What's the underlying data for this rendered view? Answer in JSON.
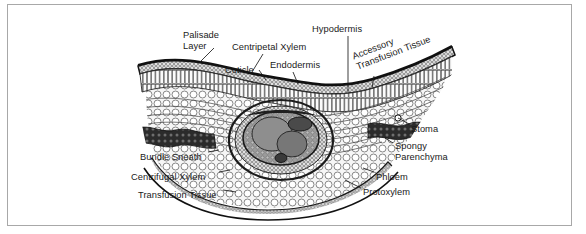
{
  "figure": {
    "style": "grayscale line drawing / scanned halftone",
    "background": "#ffffff",
    "border_color": "#a8a8a8",
    "ink_color": "#1a1a1a"
  },
  "labels": [
    {
      "id": "palisade-layer",
      "text": "Palisade\nLayer",
      "x": 183,
      "y": 30,
      "align": "left",
      "rotated": false
    },
    {
      "id": "centripetal-xylem",
      "text": "Centripetal Xylem",
      "x": 232,
      "y": 42,
      "align": "left",
      "rotated": false
    },
    {
      "id": "cuticle",
      "text": "Cuticle",
      "x": 225,
      "y": 65,
      "align": "left",
      "rotated": false
    },
    {
      "id": "endodermis",
      "text": "Endodermis",
      "x": 270,
      "y": 60,
      "align": "left",
      "rotated": false
    },
    {
      "id": "hypodermis",
      "text": "Hypodermis",
      "x": 312,
      "y": 24,
      "align": "left",
      "rotated": false
    },
    {
      "id": "accessory-transfusion-tissue",
      "text": "Accessory\nTransfusion Tissue",
      "x": 351,
      "y": 52,
      "align": "left",
      "rotated": true
    },
    {
      "id": "stoma",
      "text": "Stoma",
      "x": 411,
      "y": 124,
      "align": "left",
      "rotated": false
    },
    {
      "id": "spongy-parenchyma",
      "text": "Spongy\nParenchyma",
      "x": 395,
      "y": 141,
      "align": "left",
      "rotated": false
    },
    {
      "id": "phloem",
      "text": "Phloem",
      "x": 376,
      "y": 172,
      "align": "left",
      "rotated": false
    },
    {
      "id": "protoxylem",
      "text": "Protoxylem",
      "x": 363,
      "y": 187,
      "align": "left",
      "rotated": false
    },
    {
      "id": "bundle-sneath",
      "text": "Bundle Sneath",
      "x": 140,
      "y": 152,
      "align": "left",
      "rotated": false
    },
    {
      "id": "centrifugal-xylem",
      "text": "Centrifugal Xylem",
      "x": 131,
      "y": 172,
      "align": "left",
      "rotated": false
    },
    {
      "id": "transfusion-tissue",
      "text": "Transfusion Tissue",
      "x": 138,
      "y": 190,
      "align": "left",
      "rotated": false
    }
  ],
  "leader_lines": [
    {
      "id": "palisade-layer-leader",
      "points": "214,48 200,62"
    },
    {
      "id": "centripetal-xylem-leader",
      "points": "263,54 252,72"
    },
    {
      "id": "cuticle-leader",
      "points": "259,70 266,80"
    },
    {
      "id": "endodermis-leader",
      "points": "293,72 298,84"
    },
    {
      "id": "hypodermis-leader",
      "points": "348,36 348,92"
    },
    {
      "id": "accessory-transfusion-tissue-leader",
      "points": "374,76 372,88"
    },
    {
      "id": "stoma-leader",
      "points": "409,124 398,118"
    },
    {
      "id": "spongy-parenchyma-leader",
      "points": "393,143 385,138"
    },
    {
      "id": "phloem-leader",
      "points": "374,172 363,168"
    },
    {
      "id": "protoxylem-leader",
      "points": "361,188 345,180"
    },
    {
      "id": "bundle-sneath-leader",
      "points": "208,152 219,150"
    },
    {
      "id": "centrifugal-xylem-leader",
      "points": "219,172 230,170"
    },
    {
      "id": "transfusion-tissue-leader",
      "points": "223,190 236,192"
    }
  ]
}
